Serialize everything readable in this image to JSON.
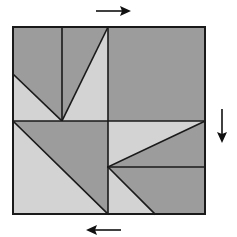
{
  "diagram": {
    "colors": {
      "dark_piece": "#9c9c9c",
      "light_piece": "#d3d3d3",
      "line": "#1a1a1a",
      "background": "#ffffff"
    },
    "quadrants": [
      {
        "name": "top-left",
        "pieces": [
          "dark-left-pentagon",
          "dark-middle-triangle",
          "light-bottom-triangle",
          "light-right-triangle"
        ]
      },
      {
        "name": "top-right",
        "pieces": [
          "dark-full-square"
        ]
      },
      {
        "name": "bottom-left",
        "pieces": [
          "dark-upper-triangle",
          "light-lower-triangle"
        ]
      },
      {
        "name": "bottom-right",
        "pieces": [
          "light-top-triangle",
          "dark-middle-triangle",
          "dark-lower-quad",
          "light-bottom-triangle"
        ]
      }
    ],
    "arrows": [
      {
        "name": "top",
        "direction": "right"
      },
      {
        "name": "right",
        "direction": "down"
      },
      {
        "name": "bottom",
        "direction": "left"
      }
    ]
  }
}
